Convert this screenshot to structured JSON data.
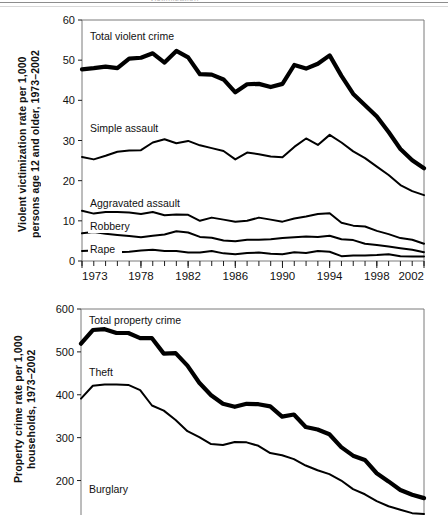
{
  "page": {
    "clipped_header_text": "victimization"
  },
  "figures": [
    {
      "id": "violent",
      "ylabel": "Violent victimization rate per 1,000\npersons age 12 and older, 1973–2002",
      "chart_data": {
        "type": "line",
        "title": "",
        "xlabel": "",
        "ylabel": "Violent victimization rate per 1,000 persons age 12 and older, 1973–2002",
        "xlim": [
          1973,
          2002
        ],
        "ylim": [
          0,
          60
        ],
        "ytick_labels": [
          "0",
          "10",
          "20",
          "30",
          "40",
          "50",
          "60"
        ],
        "ytick_values": [
          0,
          10,
          20,
          30,
          40,
          50,
          60
        ],
        "xtick_labels": [
          "1973",
          "1978",
          "1982",
          "1986",
          "1990",
          "1994",
          "1998",
          "2002"
        ],
        "xtick_values": [
          1973,
          1978,
          1982,
          1986,
          1990,
          1994,
          1998,
          2002
        ],
        "minor_xticks_every_year": true,
        "grid": false,
        "legend_position": "inline-annotations",
        "x": [
          1973,
          1974,
          1975,
          1976,
          1977,
          1978,
          1979,
          1980,
          1981,
          1982,
          1983,
          1984,
          1985,
          1986,
          1987,
          1988,
          1989,
          1990,
          1991,
          1992,
          1993,
          1994,
          1995,
          1996,
          1997,
          1998,
          1999,
          2000,
          2001,
          2002
        ],
        "series": [
          {
            "name": "Total violent crime",
            "emphasis": "bold",
            "values": [
              47.7,
              48.0,
              48.4,
              48.0,
              50.4,
              50.6,
              51.7,
              49.4,
              52.3,
              50.7,
              46.5,
              46.4,
              45.2,
              42.0,
              44.0,
              44.1,
              43.3,
              44.1,
              48.8,
              47.9,
              49.1,
              51.2,
              46.1,
              41.6,
              38.8,
              36.0,
              32.1,
              27.9,
              25.1,
              23.1
            ]
          },
          {
            "name": "Simple assault",
            "emphasis": "normal",
            "values": [
              25.9,
              25.3,
              26.2,
              27.2,
              27.5,
              27.6,
              29.5,
              30.3,
              29.3,
              29.9,
              28.8,
              28.1,
              27.4,
              25.3,
              27.0,
              26.6,
              26.0,
              25.8,
              28.4,
              30.5,
              28.9,
              31.4,
              29.5,
              27.3,
              25.6,
              23.5,
              21.4,
              18.9,
              17.4,
              16.4
            ]
          },
          {
            "name": "Aggravated assault",
            "emphasis": "normal",
            "values": [
              12.5,
              11.8,
              12.2,
              12.2,
              12.1,
              11.7,
              12.2,
              11.4,
              11.6,
              11.5,
              10.0,
              10.8,
              10.3,
              9.8,
              10.0,
              10.8,
              10.3,
              9.8,
              10.6,
              11.1,
              11.7,
              11.9,
              9.5,
              8.8,
              8.6,
              7.5,
              6.7,
              5.7,
              5.3,
              4.3
            ]
          },
          {
            "name": "Robbery",
            "emphasis": "normal",
            "values": [
              6.9,
              7.2,
              6.8,
              6.5,
              6.2,
              5.9,
              6.3,
              6.6,
              7.4,
              7.1,
              6.0,
              5.8,
              5.1,
              4.9,
              5.3,
              5.3,
              5.4,
              5.7,
              5.9,
              6.1,
              6.0,
              6.3,
              5.4,
              5.2,
              4.3,
              4.0,
              3.6,
              3.2,
              2.8,
              2.2
            ]
          },
          {
            "name": "Rape",
            "emphasis": "normal",
            "values": [
              2.5,
              2.6,
              2.4,
              2.2,
              2.3,
              2.6,
              2.8,
              2.5,
              2.5,
              2.1,
              2.1,
              2.5,
              1.9,
              1.7,
              2.0,
              2.1,
              1.8,
              1.7,
              2.2,
              2.0,
              2.5,
              2.3,
              1.2,
              1.4,
              1.4,
              1.5,
              1.7,
              1.2,
              1.1,
              1.1
            ]
          }
        ]
      }
    },
    {
      "id": "property",
      "ylabel": "Property crime rate per 1,000\nhouseholds, 1973–2002",
      "chart_data": {
        "type": "line",
        "title": "",
        "xlabel": "",
        "ylabel": "Property crime rate per 1,000 households, 1973–2002",
        "xlim": [
          1973,
          2002
        ],
        "ylim": [
          80,
          600
        ],
        "ytick_labels": [
          "100",
          "200",
          "300",
          "400",
          "500",
          "600"
        ],
        "ytick_values": [
          100,
          200,
          300,
          400,
          500,
          600
        ],
        "xtick_labels": [],
        "xtick_values": [],
        "minor_xticks_every_year": false,
        "grid": false,
        "legend_position": "inline-annotations",
        "x": [
          1973,
          1974,
          1975,
          1976,
          1977,
          1978,
          1979,
          1980,
          1981,
          1982,
          1983,
          1984,
          1985,
          1986,
          1987,
          1988,
          1989,
          1990,
          1991,
          1992,
          1993,
          1994,
          1995,
          1996,
          1997,
          1998,
          1999,
          2000,
          2001,
          2002
        ],
        "series": [
          {
            "name": "Total property crime",
            "emphasis": "bold",
            "values": [
              519,
              551,
              553,
              544,
              544,
              532,
              532,
              496,
              497,
              468,
              428,
              399,
              379,
              372,
              379,
              378,
              373,
              349,
              354,
              325,
              319,
              308,
              278,
              258,
              248,
              217,
              198,
              178,
              167,
              159
            ]
          },
          {
            "name": "Theft",
            "emphasis": "normal",
            "values": [
              391,
              421,
              424,
              424,
              423,
              411,
              375,
              363,
              341,
              315,
              301,
              285,
              283,
              290,
              289,
              281,
              264,
              259,
              250,
              235,
              224,
              215,
              200,
              180,
              168,
              152,
              140,
              132,
              124,
              122
            ]
          },
          {
            "name": "Burglary",
            "emphasis": "normal",
            "values": [
              110,
              111,
              110,
              107,
              105,
              100,
              103,
              84,
              87,
              78,
              70,
              64,
              63,
              61,
              62,
              59,
              57,
              54,
              55,
              49,
              48,
              45,
              42,
              39,
              37,
              34,
              31,
              29,
              28,
              27
            ]
          }
        ]
      }
    }
  ]
}
